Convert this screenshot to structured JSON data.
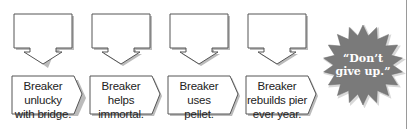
{
  "diagram": {
    "type": "sequence-chart",
    "steps": [
      {
        "callout_text": "",
        "label_lines": [
          "Breaker",
          "unlucky",
          "with bridge."
        ]
      },
      {
        "callout_text": "",
        "label_lines": [
          "Breaker",
          "helps",
          "immortal."
        ]
      },
      {
        "callout_text": "",
        "label_lines": [
          "Breaker",
          "uses",
          "pellet."
        ]
      },
      {
        "callout_text": "",
        "label_lines": [
          "Breaker",
          "rebuilds pier",
          "ever year."
        ]
      }
    ],
    "burst": {
      "lines": [
        "“Don’t",
        "give up.”"
      ],
      "color": "#7a7a7a"
    },
    "colors": {
      "stroke": "#555555",
      "shadow": "#bbbbbb",
      "fill": "#ffffff"
    }
  }
}
